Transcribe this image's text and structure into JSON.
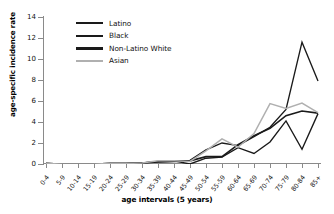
{
  "chart_data": {
    "type": "line",
    "title": "",
    "xlabel": "age intervals (5 years)",
    "ylabel": "age-specific incidence rate",
    "ylim": [
      0,
      14
    ],
    "yticks": [
      0,
      2,
      4,
      6,
      8,
      10,
      12,
      14
    ],
    "grid": false,
    "legend_position": "top-left-inside",
    "categories": [
      "0-4",
      "5-9",
      "10-14",
      "15-19",
      "20-24",
      "25-29",
      "30-34",
      "35-39",
      "40-44",
      "45-49",
      "50-54",
      "55-59",
      "60-64",
      "65-69",
      "70-74",
      "75-79",
      "80-84",
      "85+"
    ],
    "series": [
      {
        "name": "Latino",
        "color": "#1a1a1a",
        "values": [
          0.05,
          0.0,
          0.0,
          0.0,
          0.05,
          0.05,
          0.1,
          0.25,
          0.3,
          0.0,
          0.55,
          0.65,
          1.55,
          1.0,
          2.1,
          4.1,
          1.4,
          4.8
        ]
      },
      {
        "name": "Black",
        "color": "#1a1a1a",
        "values": [
          0.05,
          0.0,
          0.0,
          0.0,
          0.05,
          0.05,
          0.1,
          0.2,
          0.25,
          0.35,
          1.35,
          2.0,
          1.75,
          2.6,
          3.5,
          5.2,
          11.6,
          7.9
        ]
      },
      {
        "name": "Non-Latino White",
        "color": "#1a1a1a",
        "values": [
          0.05,
          0.0,
          0.0,
          0.0,
          0.05,
          0.05,
          0.1,
          0.2,
          0.25,
          0.3,
          0.7,
          0.7,
          1.85,
          2.7,
          3.4,
          4.6,
          5.05,
          4.85
        ]
      },
      {
        "name": "Asian",
        "color": "#b0b0b0",
        "values": [
          0.05,
          0.0,
          0.0,
          0.0,
          0.05,
          0.05,
          0.1,
          0.3,
          0.3,
          0.25,
          1.25,
          2.4,
          1.6,
          2.9,
          5.75,
          5.3,
          5.8,
          4.9
        ]
      }
    ]
  },
  "legend": {
    "items": [
      {
        "label": "Latino",
        "color": "#1a1a1a",
        "weight": 1.9
      },
      {
        "label": "Black",
        "color": "#1a1a1a",
        "weight": 1.9
      },
      {
        "label": "Non-Latino White",
        "color": "#1a1a1a",
        "weight": 2.6
      },
      {
        "label": "Asian",
        "color": "#b0b0b0",
        "weight": 1.9
      }
    ]
  },
  "axes": {
    "y_title": "age-specific incidence rate",
    "x_title": "age intervals (5 years)",
    "axis_color": "#8a8a8a"
  }
}
